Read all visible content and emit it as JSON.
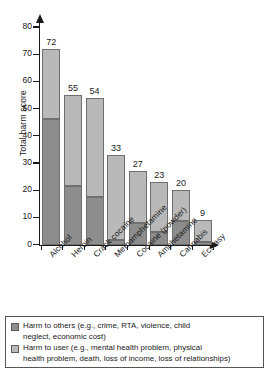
{
  "chart_data": {
    "type": "bar",
    "stacked": true,
    "title": "",
    "xlabel": "",
    "ylabel": "Total harm score",
    "ylim": [
      0,
      80
    ],
    "ytick_values": [
      0,
      10,
      20,
      30,
      40,
      50,
      60,
      70,
      80
    ],
    "grid": false,
    "legend_position": "below-plot",
    "categories": [
      "Alcohol",
      "Heroin",
      "Crack cocaine",
      "Methamphetamine",
      "Cocaine (powder)",
      "Amphetamine",
      "Cannabis",
      "Ecstasy"
    ],
    "totals": [
      72,
      55,
      54,
      33,
      27,
      23,
      20,
      9
    ],
    "series": [
      {
        "name": "Harm to others (e.g., crime, RTA, violence, child neglect, economic cost)",
        "color": "#8d8d8d",
        "values": [
          46,
          21.5,
          17.5,
          1.5,
          8,
          4.5,
          8.5,
          1
        ]
      },
      {
        "name": "Harm to user (e.g., mental health problem, physical health problem, death, loss of income, loss of relationships)",
        "color": "#b9b9b9",
        "values": [
          26,
          33.5,
          36.5,
          31.5,
          19,
          18.5,
          11.5,
          8
        ]
      }
    ],
    "data_labels": [
      "72",
      "55",
      "54",
      "33",
      "27",
      "23",
      "20",
      "9"
    ]
  },
  "legend": {
    "items": [
      {
        "swatch_name": "legend-swatch-harm-to-others",
        "line1": "Harm to others (e.g., crime, RTA, violence, child",
        "line2": "neglect, economic cost)"
      },
      {
        "swatch_name": "legend-swatch-harm-to-user",
        "line1": "Harm to user (e.g., mental health problem, physical",
        "line2": "health problem, death, loss of income, loss of relationships)"
      }
    ]
  }
}
